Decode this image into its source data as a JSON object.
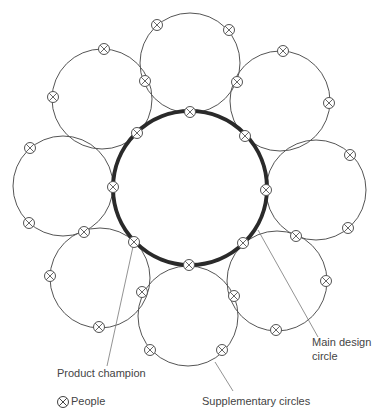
{
  "diagram": {
    "colors": {
      "line": "#555555",
      "main": "#2a2a2a",
      "text": "#444444"
    },
    "main_circle": {
      "cx": 190,
      "cy": 188,
      "r": 77,
      "stroke_width": 4
    },
    "supplementary_circles": [
      {
        "name": "top",
        "cx": 190,
        "cy": 63,
        "r": 50
      },
      {
        "name": "top-right",
        "cx": 280,
        "cy": 101,
        "r": 50
      },
      {
        "name": "right",
        "cx": 316,
        "cy": 190,
        "r": 50
      },
      {
        "name": "bottom-right",
        "cx": 277,
        "cy": 281,
        "r": 50
      },
      {
        "name": "bottom",
        "cx": 188,
        "cy": 316,
        "r": 50
      },
      {
        "name": "bottom-left",
        "cx": 100,
        "cy": 278,
        "r": 50
      },
      {
        "name": "left",
        "cx": 63,
        "cy": 186,
        "r": 50
      },
      {
        "name": "top-left",
        "cx": 102,
        "cy": 99,
        "r": 50
      }
    ],
    "people": [
      [
        157,
        25
      ],
      [
        229,
        30
      ],
      [
        145,
        81
      ],
      [
        237,
        82
      ],
      [
        190,
        112
      ],
      [
        104,
        49
      ],
      [
        53,
        97
      ],
      [
        137,
        133
      ],
      [
        283,
        51
      ],
      [
        329,
        103
      ],
      [
        245,
        136
      ],
      [
        30,
        148
      ],
      [
        29,
        223
      ],
      [
        113,
        187
      ],
      [
        84,
        232
      ],
      [
        350,
        155
      ],
      [
        348,
        228
      ],
      [
        266,
        190
      ],
      [
        296,
        236
      ],
      [
        50,
        276
      ],
      [
        99,
        327
      ],
      [
        134,
        242
      ],
      [
        142,
        292
      ],
      [
        326,
        281
      ],
      [
        276,
        330
      ],
      [
        243,
        243
      ],
      [
        234,
        296
      ],
      [
        150,
        350
      ],
      [
        222,
        350
      ],
      [
        189,
        265
      ]
    ],
    "leaders": [
      {
        "name": "product-champion-leader",
        "x1": 134,
        "y1": 242,
        "x2": 107,
        "y2": 366
      },
      {
        "name": "main-design-circle-leader",
        "x1": 258,
        "y1": 230,
        "x2": 318,
        "y2": 337
      },
      {
        "name": "supplementary-circles-leader",
        "x1": 215,
        "y1": 362,
        "x2": 233,
        "y2": 391
      }
    ],
    "labels": {
      "product_champion": "Product champion",
      "main_design_line1": "Main design",
      "main_design_line2": "circle",
      "supplementary": "Supplementary circles",
      "legend_people": "People"
    }
  }
}
